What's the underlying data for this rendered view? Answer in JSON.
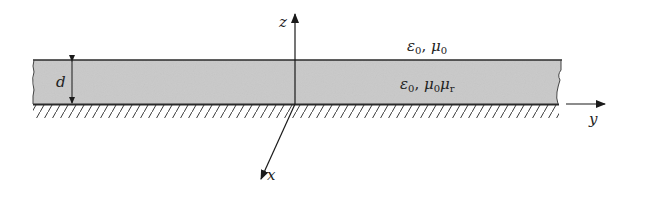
{
  "diagram": {
    "colors": {
      "background": "#ffffff",
      "slab_fill": "#c9c9c9",
      "line": "#2a2a2a",
      "text": "#222222"
    },
    "axes": {
      "z": {
        "label": "z"
      },
      "x": {
        "label": "x"
      },
      "y": {
        "label": "y"
      }
    },
    "thickness": {
      "label": "d"
    },
    "regions": {
      "upper": {
        "eps": "ε",
        "eps_sub": "0",
        "sep": ", ",
        "mu": "μ",
        "mu_sub": "0"
      },
      "slab": {
        "eps": "ε",
        "eps_sub": "0",
        "sep": ", ",
        "mu": "μ",
        "mu_sub": "0",
        "mu2": "μ",
        "mu2_sub": "r"
      }
    },
    "ground_plane": {
      "label": ""
    }
  }
}
